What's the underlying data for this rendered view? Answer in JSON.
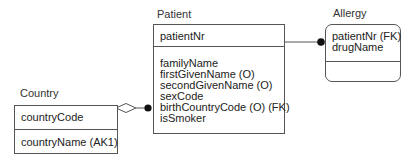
{
  "diagram": {
    "type": "IDEF1X / ER data model",
    "entities": [
      {
        "id": "patient",
        "name": "Patient",
        "key_attributes": [
          "patientNr"
        ],
        "non_key_attributes": [
          "familyName",
          "firstGivenName (O)",
          "secondGivenName (O)",
          "sexCode",
          "birthCountryCode (O) (FK)",
          "isSmoker"
        ],
        "shape": "square-corners (independent)"
      },
      {
        "id": "allergy",
        "name": "Allergy",
        "key_attributes": [
          "patientNr (FK)",
          "drugName"
        ],
        "non_key_attributes": [],
        "shape": "rounded-corners (dependent)"
      },
      {
        "id": "country",
        "name": "Country",
        "key_attributes": [
          "countryCode"
        ],
        "non_key_attributes": [
          "countryName (AK1)"
        ],
        "shape": "square-corners (independent)"
      }
    ],
    "relationships": [
      {
        "from": "country",
        "to": "patient",
        "kind": "non-identifying optional",
        "parent_end": "hollow-diamond",
        "child_end": "filled-dot"
      },
      {
        "from": "patient",
        "to": "allergy",
        "kind": "identifying",
        "parent_end": "plain",
        "child_end": "filled-dot"
      }
    ],
    "colors": {
      "line": "#555555",
      "text": "#222222",
      "background": "#ffffff"
    }
  },
  "patient": {
    "title": "Patient",
    "keys": {
      "k0": "patientNr"
    },
    "attrs": {
      "a0": "familyName",
      "a1": "firstGivenName (O)",
      "a2": "secondGivenName (O)",
      "a3": "sexCode",
      "a4": "birthCountryCode (O) (FK)",
      "a5": "isSmoker"
    }
  },
  "allergy": {
    "title": "Allergy",
    "keys": {
      "k0": "patientNr (FK)",
      "k1": "drugName"
    }
  },
  "country": {
    "title": "Country",
    "keys": {
      "k0": "countryCode"
    },
    "attrs": {
      "a0": "countryName (AK1)"
    }
  }
}
